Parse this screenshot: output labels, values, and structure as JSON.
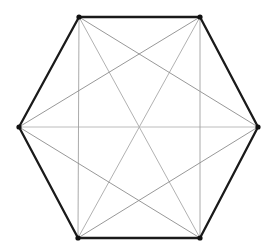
{
  "figure": {
    "background_color": "#ffffff",
    "width": 275,
    "height": 251
  },
  "style": {
    "perimeter_color": "#1a1a1a",
    "perimeter_width": 2.3,
    "main_diagonal_color": "#a8a8a8",
    "short_diagonal_color": "#8c8c8c",
    "vertical_diagonal_color": "#a0a0a0",
    "horizontal_diagonal_color": "#b4b4b4",
    "diagonal_width": 0.9,
    "vertex_color": "#111111",
    "vertex_radius": 2.6
  },
  "chart_data": {
    "type": "diagram",
    "graph_name": "K6",
    "vertex_count": 6,
    "edge_count": 15,
    "perimeter_edge_count": 6,
    "diagonal_edge_count": 9,
    "vertices": [
      {
        "id": "v0",
        "label": "top-left",
        "x": 79,
        "y": 17
      },
      {
        "id": "v1",
        "label": "top-right",
        "x": 200,
        "y": 17
      },
      {
        "id": "v2",
        "label": "right",
        "x": 258,
        "y": 127
      },
      {
        "id": "v3",
        "label": "bottom-right",
        "x": 200,
        "y": 238
      },
      {
        "id": "v4",
        "label": "bottom-left",
        "x": 78,
        "y": 238
      },
      {
        "id": "v5",
        "label": "left",
        "x": 19,
        "y": 127
      }
    ],
    "perimeter_edges": [
      {
        "from": "v0",
        "to": "v1",
        "name": "top-edge"
      },
      {
        "from": "v1",
        "to": "v2",
        "name": "upper-right-edge"
      },
      {
        "from": "v2",
        "to": "v3",
        "name": "lower-right-edge"
      },
      {
        "from": "v3",
        "to": "v4",
        "name": "bottom-edge"
      },
      {
        "from": "v4",
        "to": "v5",
        "name": "lower-left-edge"
      },
      {
        "from": "v5",
        "to": "v0",
        "name": "upper-left-edge"
      }
    ],
    "diagonal_edges": [
      {
        "from": "v0",
        "to": "v3",
        "name": "main-diagonal-tl-br",
        "kind": "main"
      },
      {
        "from": "v1",
        "to": "v4",
        "name": "main-diagonal-tr-bl",
        "kind": "main"
      },
      {
        "from": "v5",
        "to": "v2",
        "name": "main-diagonal-left-right",
        "kind": "main-horizontal"
      },
      {
        "from": "v0",
        "to": "v2",
        "name": "short-diagonal-tl-right",
        "kind": "short"
      },
      {
        "from": "v0",
        "to": "v4",
        "name": "short-diagonal-tl-bl",
        "kind": "short-vertical"
      },
      {
        "from": "v1",
        "to": "v5",
        "name": "short-diagonal-tr-left",
        "kind": "short"
      },
      {
        "from": "v1",
        "to": "v3",
        "name": "short-diagonal-tr-br",
        "kind": "short-vertical"
      },
      {
        "from": "v2",
        "to": "v4",
        "name": "short-diagonal-right-bl",
        "kind": "short"
      },
      {
        "from": "v3",
        "to": "v5",
        "name": "short-diagonal-br-left",
        "kind": "short"
      }
    ]
  }
}
